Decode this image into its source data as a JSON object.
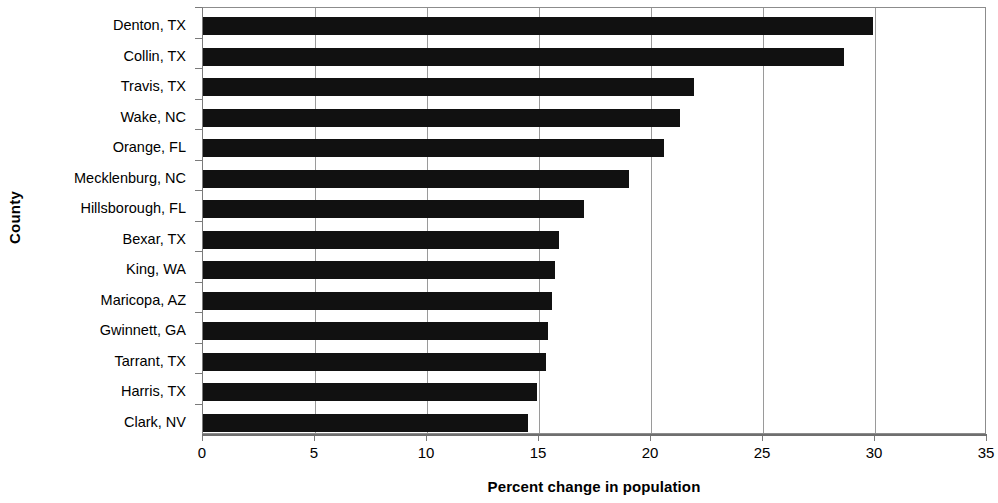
{
  "chart_data": {
    "type": "bar",
    "orientation": "horizontal",
    "title": "",
    "xlabel": "Percent change in population",
    "ylabel": "County",
    "categories": [
      "Denton, TX",
      "Collin, TX",
      "Travis, TX",
      "Wake, NC",
      "Orange, FL",
      "Mecklenburg, NC",
      "Hillsborough, FL",
      "Bexar, TX",
      "King, WA",
      "Maricopa, AZ",
      "Gwinnett, GA",
      "Tarrant, TX",
      "Harris, TX",
      "Clark, NV"
    ],
    "values": [
      29.9,
      28.6,
      21.9,
      21.3,
      20.6,
      19.0,
      17.0,
      15.9,
      15.7,
      15.6,
      15.4,
      15.3,
      14.9,
      14.5
    ],
    "xlim": [
      0,
      35
    ],
    "xticks": [
      0,
      5,
      10,
      15,
      20,
      25,
      30,
      35
    ],
    "xtick_labels": [
      "0",
      "5",
      "10",
      "15",
      "20",
      "25",
      "30",
      "35"
    ],
    "grid": "vertical",
    "legend": "none",
    "bar_color": "#111111"
  }
}
